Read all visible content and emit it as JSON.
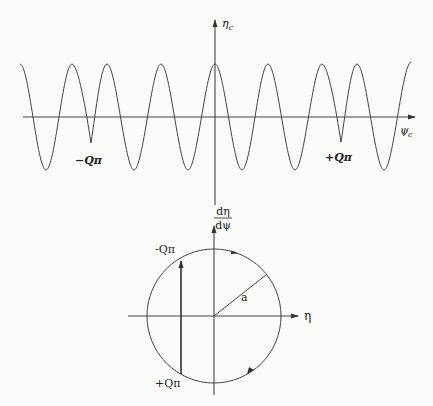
{
  "top_plot": {
    "y_axis_label": "η",
    "y_axis_label_sub": "c",
    "x_axis_label": "ψ",
    "x_axis_label_sub": "c",
    "cusp_left_label": "−Qπ",
    "cusp_right_label": "+Qπ"
  },
  "bottom_plot": {
    "y_axis_label_num": "dη",
    "y_axis_label_den": "dψ",
    "x_axis_label": "η",
    "radius_label": "a",
    "top_chord_label": "-Qπ",
    "bottom_chord_label": "+Qπ"
  },
  "colors": {
    "ink": "#3a3a3a",
    "background": "#fbfbf9"
  }
}
